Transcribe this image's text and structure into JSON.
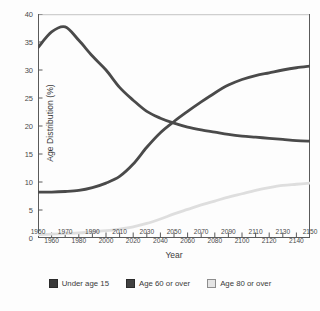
{
  "chart_data": {
    "type": "line",
    "title": "",
    "xlabel": "Year",
    "ylabel": "Age Distribution (%)",
    "xlim": [
      1950,
      2150
    ],
    "ylim": [
      0,
      40
    ],
    "grid": false,
    "legend_position": "bottom",
    "y_ticks": [
      0,
      5,
      10,
      15,
      20,
      25,
      30,
      35,
      40
    ],
    "y_tick_labels": [
      "0",
      "5",
      "10",
      "15",
      "20",
      "25",
      "30",
      "35",
      "40"
    ],
    "x_ticks": [
      1950,
      1960,
      1970,
      1980,
      1990,
      2000,
      2010,
      2020,
      2030,
      2040,
      2050,
      2060,
      2070,
      2080,
      2090,
      2100,
      2110,
      2120,
      2130,
      2140,
      2150
    ],
    "x_tick_labels_top": [
      "1950",
      "1970",
      "1990",
      "2010",
      "2030",
      "2050",
      "2070",
      "2090",
      "2110",
      "2130",
      "2150"
    ],
    "x_tick_labels_bottom": [
      "1960",
      "1980",
      "2000",
      "2020",
      "2040",
      "2060",
      "2080",
      "2100",
      "2120",
      "2140"
    ],
    "x": [
      1950,
      1960,
      1970,
      1980,
      1990,
      2000,
      2010,
      2020,
      2030,
      2040,
      2050,
      2060,
      2070,
      2080,
      2090,
      2100,
      2110,
      2120,
      2130,
      2140,
      2150
    ],
    "series": [
      {
        "name": "Under age 15",
        "color": "#4a4a4a",
        "values": [
          34.0,
          36.8,
          37.7,
          35.3,
          32.5,
          30.0,
          26.9,
          24.6,
          22.6,
          21.4,
          20.5,
          19.8,
          19.3,
          18.9,
          18.5,
          18.2,
          18.0,
          17.8,
          17.6,
          17.4,
          17.3
        ]
      },
      {
        "name": "Age 60 or over",
        "color": "#4a4a4a",
        "values": [
          8.2,
          8.2,
          8.3,
          8.5,
          9.0,
          9.8,
          11.0,
          13.2,
          16.2,
          18.8,
          20.8,
          22.6,
          24.3,
          25.9,
          27.3,
          28.3,
          29.0,
          29.5,
          30.0,
          30.4,
          30.7
        ]
      },
      {
        "name": "Age 80 or over",
        "color": "#dedede",
        "values": [
          0.6,
          0.7,
          0.8,
          0.9,
          1.1,
          1.3,
          1.6,
          2.0,
          2.6,
          3.4,
          4.3,
          5.1,
          5.9,
          6.6,
          7.3,
          7.9,
          8.5,
          9.0,
          9.4,
          9.6,
          9.8
        ]
      }
    ]
  },
  "legend": {
    "items": [
      {
        "label": "Under age 15",
        "swatch_color": "#3a3a3a",
        "swatch_border": "#2b2b2b"
      },
      {
        "label": "Age 60 or over",
        "swatch_color": "#414141",
        "swatch_border": "#2b2b2b"
      },
      {
        "label": "Age 80 or over",
        "swatch_color": "#e4e4e4",
        "swatch_border": "#8d8d8d"
      }
    ]
  },
  "axes": {
    "spine_color": "#5a5a5a",
    "top_rule_color": "#cfcfcf"
  }
}
